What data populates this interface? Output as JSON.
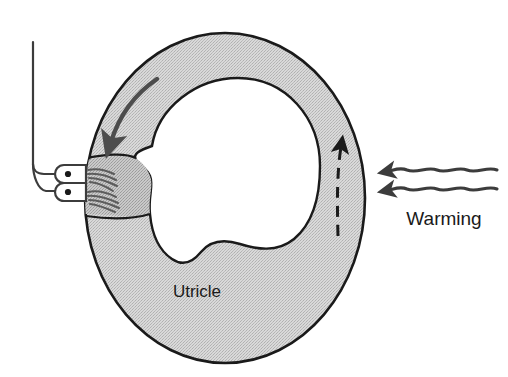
{
  "figure": {
    "background_color": "#ffffff",
    "ink_color": "#1a1a1a",
    "membrane_fill_color": "#cccccc",
    "lumen_fill_color": "#ffffff"
  },
  "labels": {
    "utricle": "Utricle",
    "warming": "Warming"
  },
  "structures": {
    "canal_ring": {
      "name": "semicircular-canal-ring",
      "fill": "#cccccc",
      "stroke": "#1a1a1a"
    },
    "lumen": {
      "name": "canal-lumen",
      "fill": "#ffffff",
      "stroke": "#1a1a1a"
    },
    "ampulla": {
      "name": "ampulla-with-cupula",
      "fill": "#c2c2c2"
    },
    "nerve_fiber": {
      "name": "vestibular-nerve-fiber",
      "stroke": "#3c3c3c"
    },
    "nerve_terminals": [
      {
        "name": "nerve-terminal-upper"
      },
      {
        "name": "nerve-terminal-lower"
      }
    ],
    "hair_cell_bundles": [
      {
        "name": "hair-cell-bundle-upper"
      },
      {
        "name": "hair-cell-bundle-lower"
      }
    ]
  },
  "arrows": {
    "endolymph_flow": {
      "name": "endolymph-flow-arrow",
      "style": "solid",
      "direction": "down-left",
      "color": "#4d4d4d"
    },
    "convection_rise": {
      "name": "convection-rise-arrow",
      "style": "dashed",
      "direction": "up",
      "color": "#1a1a1a"
    },
    "warming_rays": [
      {
        "name": "warming-ray-upper",
        "style": "wavy",
        "direction": "left",
        "color": "#3c3c3c"
      },
      {
        "name": "warming-ray-lower",
        "style": "wavy",
        "direction": "left",
        "color": "#3c3c3c"
      }
    ]
  }
}
